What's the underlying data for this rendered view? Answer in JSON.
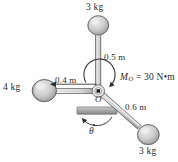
{
  "figure": {
    "background_color": "#fefefe",
    "ink_color": "#2b2b2b",
    "rod_fill": "#e3e3e3",
    "rod_stroke": "#555555",
    "ball_fill": "#c9c9c9",
    "ball_stroke": "#4a4a4a",
    "ground_fill": "#b5b5b5"
  },
  "masses": {
    "top": {
      "label": "3 kg",
      "value": 3,
      "unit": "kg"
    },
    "left": {
      "label": "4 kg",
      "value": 4,
      "unit": "kg"
    },
    "bottom_right": {
      "label": "3 kg",
      "value": 3,
      "unit": "kg"
    }
  },
  "dimensions": {
    "top_rod": {
      "label": "0.5 m",
      "value": 0.5,
      "unit": "m"
    },
    "left_rod": {
      "label": "0.4 m",
      "value": 0.4,
      "unit": "m"
    },
    "lower_right_rod": {
      "label": "0.6 m",
      "value": 0.6,
      "unit": "m"
    }
  },
  "moment": {
    "symbol": "M",
    "subscript": "O",
    "equals": " = ",
    "magnitude": "30",
    "unit": " N•m",
    "full_label": "M_O = 30 N•m"
  },
  "pivot": {
    "label": "O",
    "name": "pivot-point-O"
  },
  "angular_velocity": {
    "label": "θ",
    "notation": "theta-dot",
    "description": "angular velocity theta dot, counterclockwise"
  }
}
